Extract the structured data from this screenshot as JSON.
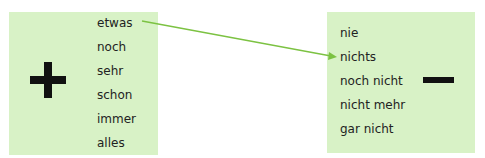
{
  "left_box": {
    "symbol": "plus-icon",
    "words": [
      "etwas",
      "noch",
      "sehr",
      "schon",
      "immer",
      "alles"
    ]
  },
  "right_box": {
    "symbol": "minus-icon",
    "words": [
      "nie",
      "nichts",
      "noch nicht",
      "nicht mehr",
      "gar nicht"
    ]
  },
  "arrow": {
    "from": "etwas",
    "to": "nichts",
    "color": "#7cc242"
  },
  "colors": {
    "box_fill": "#d8f2c6",
    "text": "#222222",
    "symbol": "#111111"
  }
}
